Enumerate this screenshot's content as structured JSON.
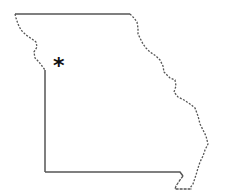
{
  "map": {
    "region": "Missouri state outline",
    "outline_color": "#555555",
    "marker": {
      "symbol": "*",
      "color": "#111111",
      "x": 53,
      "y": 55
    }
  }
}
